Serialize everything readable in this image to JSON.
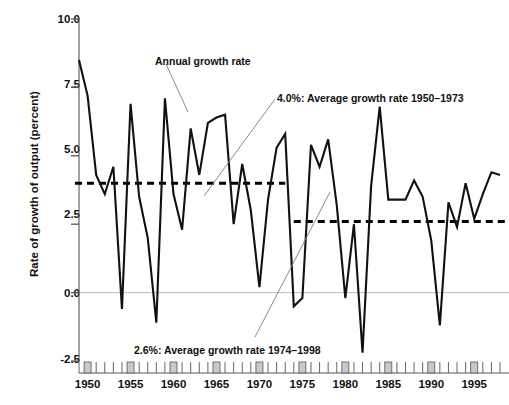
{
  "chart_data": {
    "type": "line",
    "title": "",
    "xlabel": "",
    "ylabel": "Rate of growth of output (percent)",
    "ylim": [
      -2.5,
      10.0
    ],
    "xlim": [
      1949,
      1998
    ],
    "yticks": [
      "10.0",
      "7.5",
      "5.0",
      "2.5",
      "0.0",
      "-2.5"
    ],
    "ytick_values": [
      10.0,
      7.5,
      5.0,
      2.5,
      0.0,
      -2.5
    ],
    "xticks": [
      "1950",
      "1955",
      "1960",
      "1965",
      "1970",
      "1975",
      "1980",
      "1985",
      "1990",
      "1995"
    ],
    "xtick_values": [
      1950,
      1955,
      1960,
      1965,
      1970,
      1975,
      1980,
      1985,
      1990,
      1995
    ],
    "grid": false,
    "zero_line": true,
    "legend": "none",
    "series": [
      {
        "name": "Annual growth rate",
        "x": [
          1949,
          1950,
          1951,
          1952,
          1953,
          1954,
          1955,
          1956,
          1957,
          1958,
          1959,
          1960,
          1961,
          1962,
          1963,
          1964,
          1965,
          1966,
          1967,
          1968,
          1969,
          1970,
          1971,
          1972,
          1973,
          1974,
          1975,
          1976,
          1977,
          1978,
          1979,
          1980,
          1981,
          1982,
          1983,
          1984,
          1985,
          1986,
          1987,
          1988,
          1989,
          1990,
          1991,
          1992,
          1993,
          1994,
          1995,
          1996,
          1997,
          1998
        ],
        "values": [
          8.5,
          7.2,
          4.3,
          3.6,
          4.6,
          -0.6,
          6.9,
          3.5,
          2.0,
          -1.1,
          7.1,
          3.6,
          2.3,
          6.0,
          4.3,
          6.2,
          6.4,
          6.5,
          2.5,
          4.7,
          3.0,
          0.2,
          3.4,
          5.3,
          5.8,
          -0.5,
          -0.2,
          5.4,
          4.6,
          5.6,
          3.2,
          -0.2,
          2.5,
          -2.2,
          3.9,
          6.8,
          3.4,
          3.4,
          3.4,
          4.1,
          3.5,
          1.9,
          -1.2,
          3.3,
          2.4,
          4.0,
          2.7,
          3.6,
          4.4,
          4.3
        ]
      }
    ],
    "reference_lines": [
      {
        "label": "4.0%: Average growth rate 1950–1973",
        "value": 4.0,
        "x_start": 1949,
        "x_end": 1973,
        "style": "dashed"
      },
      {
        "label": "2.6%: Average growth rate 1974–1998",
        "value": 2.6,
        "x_start": 1974,
        "x_end": 1998,
        "style": "dashed"
      }
    ],
    "annotations": [
      {
        "text": "Annual growth rate",
        "x": 155,
        "y": 55
      },
      {
        "text": "4.0%: Average growth rate 1950–1973",
        "x": 277,
        "y": 92
      },
      {
        "text": "2.6%: Average growth rate 1974–1998",
        "x": 134,
        "y": 344
      }
    ],
    "colors": {
      "series_line": "#111111",
      "reference_line": "#000000",
      "zero_line": "#bbbbbb",
      "axis": "#555555",
      "tick_major_fill": "#c9c9c9",
      "text": "#111111",
      "background": "#ffffff"
    }
  }
}
